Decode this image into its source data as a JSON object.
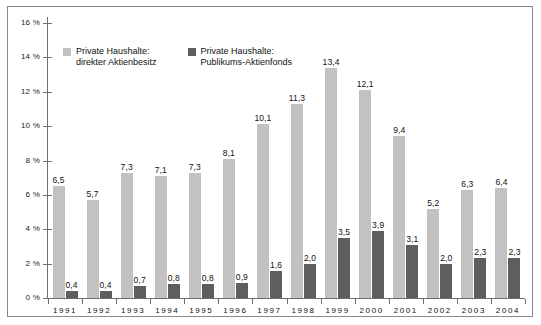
{
  "chart_data": {
    "type": "bar",
    "title": "",
    "xlabel": "",
    "ylabel": "",
    "ylim": [
      0,
      16
    ],
    "ytick_step": 2,
    "ytick_labels": [
      "0 %",
      "2 %",
      "4 %",
      "6 %",
      "8 %",
      "10 %",
      "12 %",
      "14 %",
      "16 %"
    ],
    "ytick_values": [
      0,
      2,
      4,
      6,
      8,
      10,
      12,
      14,
      16
    ],
    "grid": false,
    "legend_position": "top-left",
    "decimal_separator": ",",
    "categories": [
      "1991",
      "1992",
      "1993",
      "1994",
      "1995",
      "1996",
      "1997",
      "1998",
      "1999",
      "2000",
      "2001",
      "2002",
      "2003",
      "2004"
    ],
    "series": [
      {
        "name": "Private Haushalte:\ndirekter Aktienbesitz",
        "color": "#c2c2c2",
        "values": [
          6.5,
          5.7,
          7.3,
          7.1,
          7.3,
          8.1,
          10.1,
          11.3,
          13.4,
          12.1,
          9.4,
          5.2,
          6.3,
          6.4
        ],
        "labels": [
          "6,5",
          "5,7",
          "7,3",
          "7,1",
          "7,3",
          "8,1",
          "10,1",
          "11,3",
          "13,4",
          "12,1",
          "9,4",
          "5,2",
          "6,3",
          "6,4"
        ]
      },
      {
        "name": "Private Haushalte:\nPublikums-Aktienfonds",
        "color": "#5e5e5e",
        "values": [
          0.4,
          0.4,
          0.7,
          0.8,
          0.8,
          0.9,
          1.6,
          2.0,
          3.5,
          3.9,
          3.1,
          2.0,
          2.3,
          2.3
        ],
        "labels": [
          "0,4",
          "0,4",
          "0,7",
          "0,8",
          "0,8",
          "0,9",
          "1,6",
          "2,0",
          "3,5",
          "3,9",
          "3,1",
          "2,0",
          "2,3",
          "2,3"
        ]
      }
    ]
  },
  "legend": {
    "entries": [
      {
        "label": "Private Haushalte:\ndirekter Aktienbesitz",
        "swatch": "light-gray-swatch"
      },
      {
        "label": "Private Haushalte:\nPublikums-Aktienfonds",
        "swatch": "dark-gray-swatch"
      }
    ]
  }
}
